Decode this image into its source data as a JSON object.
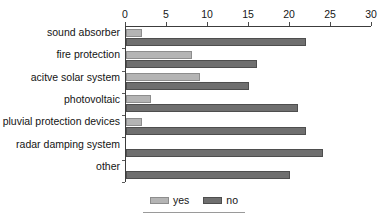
{
  "chart_data": {
    "type": "bar",
    "orientation": "horizontal",
    "title": "",
    "subtitle": "",
    "xlabel": "",
    "ylabel": "",
    "xlim": [
      0,
      30
    ],
    "xticks": [
      0,
      5,
      10,
      15,
      20,
      25,
      30
    ],
    "xtick_labels": [
      "0",
      "5",
      "10",
      "15",
      "20",
      "25",
      "30"
    ],
    "grid": false,
    "axis_label_position": "top",
    "legend_position": "bottom-center",
    "categories": [
      "sound absorber",
      "fire protection",
      "acitve solar system",
      "photovoltaic",
      "pluvial protection devices",
      "radar damping system",
      "other"
    ],
    "series": [
      {
        "name": "yes",
        "color": "#b4b4b4",
        "values": [
          2,
          8,
          9,
          3,
          2,
          0,
          0
        ]
      },
      {
        "name": "no",
        "color": "#6f6f6f",
        "values": [
          22,
          16,
          15,
          21,
          22,
          24,
          20
        ]
      }
    ],
    "legend": [
      "yes",
      "no"
    ]
  }
}
